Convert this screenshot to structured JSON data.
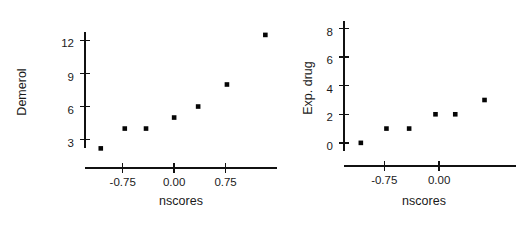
{
  "figure": {
    "background_color": "#ffffff",
    "marker_color": "#050505",
    "axis_color": "#111111",
    "panel_count": 2
  },
  "chart_data": [
    {
      "type": "scatter",
      "title": "",
      "xlabel": "nscores",
      "ylabel": "Demerol",
      "xlim": [
        -1.3,
        1.5
      ],
      "ylim": [
        1.6,
        13.4
      ],
      "grid": false,
      "legend": null,
      "xticks": [
        -0.75,
        0.0,
        0.75
      ],
      "xticklabels": [
        "-0.75",
        "0.00",
        "0.75"
      ],
      "yticks": [
        3,
        6,
        9,
        12
      ],
      "yticklabels": [
        "3",
        "6",
        "9",
        "12"
      ],
      "points": [
        {
          "x": -1.07,
          "y": 2.2
        },
        {
          "x": -0.72,
          "y": 4.0
        },
        {
          "x": -0.41,
          "y": 4.0
        },
        {
          "x": 0.0,
          "y": 5.0
        },
        {
          "x": 0.35,
          "y": 6.0
        },
        {
          "x": 0.77,
          "y": 8.0
        },
        {
          "x": 1.33,
          "y": 12.5
        }
      ]
    },
    {
      "type": "scatter",
      "title": "",
      "xlabel": "nscores",
      "ylabel": "Exp. drug",
      "xlim": [
        -1.3,
        1.05
      ],
      "ylim": [
        -0.5,
        8.6
      ],
      "grid": false,
      "legend": null,
      "xticks": [
        -0.75,
        0.0
      ],
      "xticklabels": [
        "-0.75",
        "0.00"
      ],
      "yticks": [
        0,
        2,
        4,
        6,
        8
      ],
      "yticklabels": [
        "0",
        "2",
        "4",
        "6",
        "8"
      ],
      "points": [
        {
          "x": -1.07,
          "y": 0.0
        },
        {
          "x": -0.72,
          "y": 1.0
        },
        {
          "x": -0.41,
          "y": 1.0
        },
        {
          "x": -0.05,
          "y": 2.0
        },
        {
          "x": 0.22,
          "y": 2.0
        },
        {
          "x": 0.62,
          "y": 3.0
        }
      ]
    }
  ]
}
